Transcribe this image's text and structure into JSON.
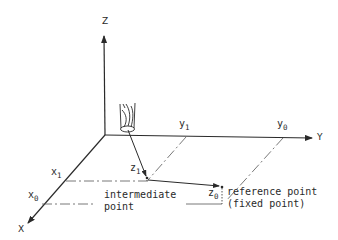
{
  "diagram": {
    "type": "3d-coordinate-system",
    "axes": {
      "z": {
        "label": "Z"
      },
      "y": {
        "label": "Y"
      },
      "x": {
        "label": "X"
      }
    },
    "coordinates": {
      "y1": {
        "base": "y",
        "sub": "1"
      },
      "y0": {
        "base": "y",
        "sub": "0"
      },
      "x1": {
        "base": "x",
        "sub": "1"
      },
      "x0": {
        "base": "x",
        "sub": "0"
      },
      "z1": {
        "base": "z",
        "sub": "1"
      },
      "z0": {
        "base": "z",
        "sub": "0"
      }
    },
    "annotations": {
      "intermediate_line1": "intermediate",
      "intermediate_line2": "point",
      "reference_line1": "reference point",
      "reference_line2": "(fixed point)"
    },
    "colors": {
      "ink": "#2a2a2a",
      "background": "#ffffff"
    }
  }
}
